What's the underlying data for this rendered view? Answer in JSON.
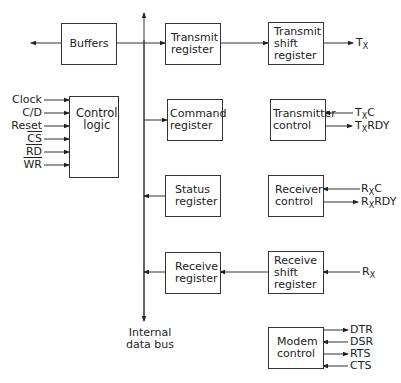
{
  "diagram": {
    "type": "block-diagram",
    "bus": {
      "label_line1": "Internal",
      "label_line2": "data bus"
    },
    "blocks": {
      "buffers": {
        "line1": "Buffers"
      },
      "transmit_register": {
        "line1": "Transmit",
        "line2": "register"
      },
      "transmit_shift_register": {
        "line1": "Transmit",
        "line2": "shift",
        "line3": "register"
      },
      "control_logic": {
        "line1": "Control",
        "line2": "logic"
      },
      "command_register": {
        "line1": "Command",
        "line2": "register"
      },
      "transmitter_control": {
        "line1": "Transmitter",
        "line2": "control"
      },
      "status_register": {
        "line1": "Status",
        "line2": "register"
      },
      "receiver_control": {
        "line1": "Receiver",
        "line2": "control"
      },
      "receive_register": {
        "line1": "Receive",
        "line2": "register"
      },
      "receive_shift_register": {
        "line1": "Receive",
        "line2": "shift",
        "line3": "register"
      },
      "modem_control": {
        "line1": "Modem",
        "line2": "control"
      }
    },
    "control_inputs": [
      {
        "label": "Clock",
        "overline": false
      },
      {
        "label": "C/D",
        "overline": false
      },
      {
        "label": "Reset",
        "overline": false
      },
      {
        "label": "CS",
        "overline": true
      },
      {
        "label": "RD",
        "overline": true
      },
      {
        "label": "WR",
        "overline": true
      }
    ],
    "signals": {
      "tx": {
        "main": "T",
        "sub": "X"
      },
      "txc": {
        "main": "T",
        "sub": "X",
        "suffix": "C"
      },
      "txrdy": {
        "main": "T",
        "sub": "X",
        "suffix": "RDY"
      },
      "rxc": {
        "main": "R",
        "sub": "X",
        "suffix": "C"
      },
      "rxrdy": {
        "main": "R",
        "sub": "X",
        "suffix": "RDY"
      },
      "rx": {
        "main": "R",
        "sub": "X"
      }
    },
    "modem_signals": [
      {
        "label": "DTR",
        "direction": "out"
      },
      {
        "label": "DSR",
        "direction": "in"
      },
      {
        "label": "RTS",
        "direction": "out"
      },
      {
        "label": "CTS",
        "direction": "in"
      }
    ]
  }
}
